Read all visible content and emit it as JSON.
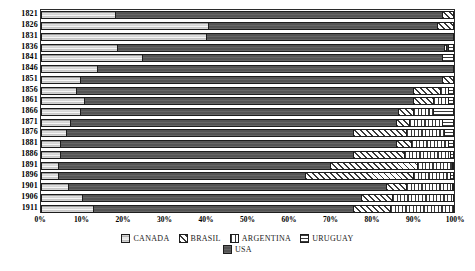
{
  "chart_data": {
    "type": "bar",
    "title": "",
    "subtitle": "",
    "xlabel": "",
    "ylabel": "",
    "orientation": "horizontal",
    "stacked": true,
    "normalized": true,
    "grid": false,
    "legend_position": "bottom",
    "xlim": [
      0,
      100
    ],
    "xticks": [
      "0%",
      "10%",
      "20%",
      "30%",
      "40%",
      "50%",
      "60%",
      "70%",
      "80%",
      "90%",
      "100%"
    ],
    "xtick_values": [
      0,
      10,
      20,
      30,
      40,
      50,
      60,
      70,
      80,
      90,
      100
    ],
    "categories": [
      "1821",
      "1826",
      "1831",
      "1836",
      "1841",
      "1846",
      "1851",
      "1856",
      "1861",
      "1866",
      "1871",
      "1876",
      "1881",
      "1886",
      "1891",
      "1896",
      "1901",
      "1906",
      "1911"
    ],
    "series": [
      {
        "name": "CANADA",
        "pattern": "gradient-gray",
        "values": [
          18.0,
          40.5,
          40.0,
          18.5,
          24.5,
          13.5,
          9.5,
          8.5,
          10.5,
          9.5,
          7.0,
          6.0,
          4.5,
          4.5,
          4.0,
          4.0,
          6.5,
          10.0,
          12.5
        ]
      },
      {
        "name": "USA",
        "pattern": "solid-dark",
        "values": [
          79.0,
          55.5,
          60.0,
          79.0,
          72.5,
          86.5,
          87.5,
          81.5,
          79.5,
          77.0,
          79.0,
          69.5,
          81.5,
          71.0,
          66.0,
          60.0,
          77.0,
          67.5,
          63.0
        ]
      },
      {
        "name": "BRASIL",
        "pattern": "diagonal-hatch",
        "values": [
          3.0,
          4.0,
          0.0,
          0.5,
          0.0,
          0.0,
          3.0,
          6.5,
          5.0,
          3.5,
          3.0,
          13.0,
          3.5,
          12.5,
          21.0,
          26.0,
          5.0,
          7.5,
          9.0
        ]
      },
      {
        "name": "ARGENTINA",
        "pattern": "vertical-lines",
        "values": [
          0.0,
          0.0,
          0.0,
          0.5,
          0.0,
          0.0,
          0.0,
          2.0,
          3.5,
          5.0,
          8.0,
          9.0,
          9.0,
          11.0,
          8.5,
          9.0,
          11.0,
          15.0,
          15.5
        ]
      },
      {
        "name": "URUGUAY",
        "pattern": "horizontal-lines",
        "values": [
          0.0,
          0.0,
          0.0,
          1.5,
          3.0,
          0.0,
          0.0,
          1.5,
          1.5,
          5.0,
          3.0,
          2.5,
          1.5,
          1.0,
          0.5,
          1.0,
          0.5,
          0.0,
          0.0
        ]
      }
    ]
  },
  "legend": {
    "rows": [
      [
        {
          "label": "CANADA",
          "swatch": "canada-swatch"
        },
        {
          "label": "BRASIL",
          "swatch": "brasil-swatch"
        },
        {
          "label": "ARGENTINA",
          "swatch": "argentina-swatch"
        },
        {
          "label": "URUGUAY",
          "swatch": "uruguay-swatch"
        }
      ],
      [
        {
          "label": "USA",
          "swatch": "usa-swatch"
        }
      ]
    ]
  },
  "colors": {
    "canada": "#cfcfcf",
    "usa": "#545454",
    "hatch_ink": "#3a3a3a",
    "hatch_bg": "#ffffff",
    "frame": "#2b2b2b",
    "text": "#000000",
    "background": "#ffffff"
  }
}
